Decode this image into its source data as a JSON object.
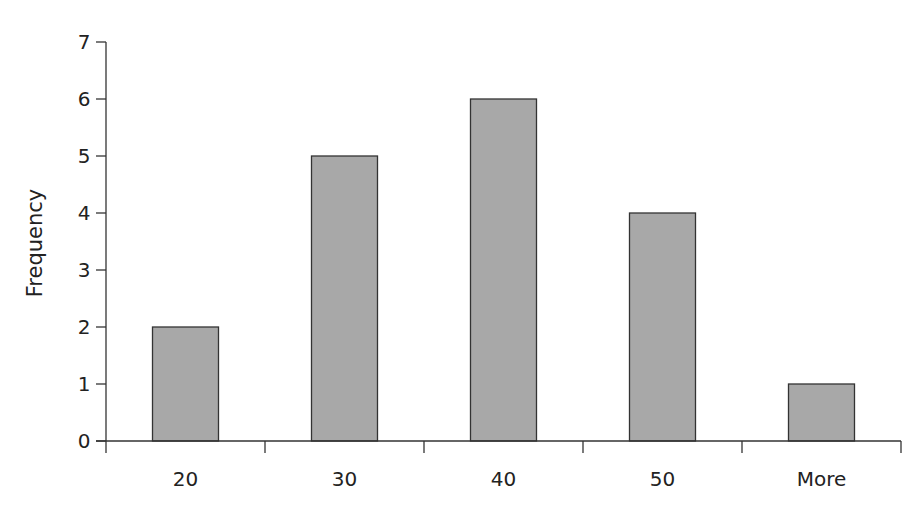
{
  "chart_data": {
    "type": "bar",
    "title": "",
    "xlabel": "",
    "ylabel": "Frequency",
    "categories": [
      "20",
      "30",
      "40",
      "50",
      "More"
    ],
    "values": [
      2,
      5,
      6,
      4,
      1
    ],
    "ylim": [
      0,
      7
    ],
    "yticks": [
      0,
      1,
      2,
      3,
      4,
      5,
      6,
      7
    ],
    "grid": false,
    "legend": null,
    "bar_color": "#a8a8a8",
    "bar_edge_color": "#333333"
  }
}
